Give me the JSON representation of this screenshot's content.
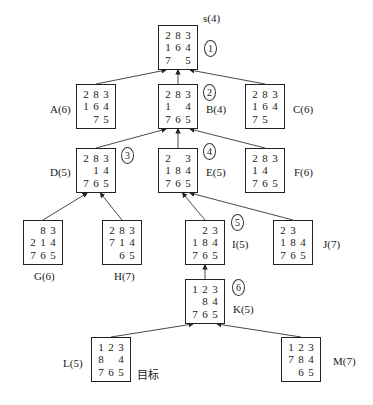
{
  "diagram": {
    "type": "eight-puzzle-search-tree",
    "nodes": [
      {
        "id": "s",
        "label": "s(4)",
        "order": "1",
        "x": 158,
        "y": 25,
        "lx": 203,
        "ly": 12,
        "ox": 204,
        "oy": 40,
        "grid": [
          "2",
          "8",
          "3",
          "1",
          "6",
          "4",
          "7",
          "",
          "5"
        ]
      },
      {
        "id": "A",
        "label": "A(6)",
        "order": "",
        "x": 76,
        "y": 84,
        "lx": 50,
        "ly": 103,
        "grid": [
          "2",
          "8",
          "3",
          "1",
          "6",
          "4",
          "",
          "7",
          "5"
        ]
      },
      {
        "id": "B",
        "label": "B(4)",
        "order": "2",
        "x": 158,
        "y": 84,
        "lx": 206,
        "ly": 103,
        "ox": 203,
        "oy": 84,
        "grid": [
          "2",
          "8",
          "3",
          "1",
          "",
          "4",
          "7",
          "6",
          "5"
        ]
      },
      {
        "id": "C",
        "label": "C(6)",
        "order": "",
        "x": 245,
        "y": 84,
        "lx": 293,
        "ly": 103,
        "grid": [
          "2",
          "8",
          "3",
          "1",
          "6",
          "4",
          "7",
          "5",
          ""
        ]
      },
      {
        "id": "D",
        "label": "D(5)",
        "order": "3",
        "x": 76,
        "y": 148,
        "lx": 50,
        "ly": 166,
        "ox": 121,
        "oy": 147,
        "grid": [
          "2",
          "8",
          "3",
          "",
          "1",
          "4",
          "7",
          "6",
          "5"
        ]
      },
      {
        "id": "E",
        "label": "E(5)",
        "order": "4",
        "x": 158,
        "y": 148,
        "lx": 206,
        "ly": 166,
        "ox": 203,
        "oy": 143,
        "grid": [
          "2",
          "",
          "3",
          "1",
          "8",
          "4",
          "7",
          "6",
          "5"
        ]
      },
      {
        "id": "F",
        "label": "F(6)",
        "order": "",
        "x": 245,
        "y": 148,
        "lx": 294,
        "ly": 166,
        "grid": [
          "2",
          "8",
          "3",
          "1",
          "4",
          "",
          "7",
          "6",
          "5"
        ]
      },
      {
        "id": "G",
        "label": "G(6)",
        "order": "",
        "x": 23,
        "y": 220,
        "lx": 34,
        "ly": 270,
        "grid": [
          "",
          "8",
          "3",
          "2",
          "1",
          "4",
          "7",
          "6",
          "5"
        ]
      },
      {
        "id": "H",
        "label": "H(7)",
        "order": "",
        "x": 102,
        "y": 220,
        "lx": 114,
        "ly": 270,
        "grid": [
          "2",
          "8",
          "3",
          "7",
          "1",
          "4",
          "",
          "6",
          "5"
        ]
      },
      {
        "id": "I",
        "label": "I(5)",
        "order": "5",
        "x": 185,
        "y": 220,
        "lx": 232,
        "ly": 238,
        "ox": 231,
        "oy": 214,
        "grid": [
          "",
          "2",
          "3",
          "1",
          "8",
          "4",
          "7",
          "6",
          "5"
        ]
      },
      {
        "id": "J",
        "label": "J(7)",
        "order": "",
        "x": 273,
        "y": 220,
        "lx": 323,
        "ly": 238,
        "grid": [
          "2",
          "3",
          "",
          "1",
          "8",
          "4",
          "7",
          "6",
          "5"
        ]
      },
      {
        "id": "K",
        "label": "K(5)",
        "order": "6",
        "x": 185,
        "y": 279,
        "lx": 233,
        "ly": 303,
        "ox": 232,
        "oy": 279,
        "grid": [
          "1",
          "2",
          "3",
          "",
          "8",
          "4",
          "7",
          "6",
          "5"
        ]
      },
      {
        "id": "L",
        "label": "L(5)",
        "order": "",
        "x": 91,
        "y": 337,
        "lx": 63,
        "ly": 357,
        "grid": [
          "1",
          "2",
          "3",
          "8",
          "",
          "4",
          "7",
          "6",
          "5"
        ]
      },
      {
        "id": "M",
        "label": "M(7)",
        "order": "",
        "x": 281,
        "y": 337,
        "lx": 333,
        "ly": 355,
        "grid": [
          "1",
          "2",
          "3",
          "7",
          "8",
          "4",
          "",
          "6",
          "5"
        ]
      }
    ],
    "edges": [
      [
        "A",
        "s"
      ],
      [
        "B",
        "s"
      ],
      [
        "C",
        "s"
      ],
      [
        "D",
        "B"
      ],
      [
        "E",
        "B"
      ],
      [
        "F",
        "B"
      ],
      [
        "G",
        "D"
      ],
      [
        "H",
        "D"
      ],
      [
        "I",
        "E"
      ],
      [
        "J",
        "E"
      ],
      [
        "K",
        "I"
      ],
      [
        "L",
        "K"
      ],
      [
        "M",
        "K"
      ]
    ],
    "goal_annotation": {
      "text": "目标",
      "x": 137,
      "y": 366
    }
  }
}
